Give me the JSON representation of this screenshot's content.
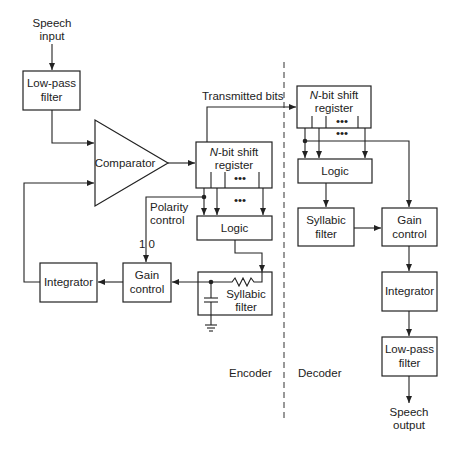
{
  "diagram": {
    "sections": {
      "encoder": "Encoder",
      "decoder": "Decoder"
    },
    "encoder": {
      "speech_input": [
        "Speech",
        "input"
      ],
      "lowpass": [
        "Low-pass",
        "filter"
      ],
      "comparator": "Comparator",
      "shift_register": {
        "prefix": "N",
        "line1": "-bit shift",
        "line2": "register"
      },
      "logic": "Logic",
      "polarity_control": [
        "Polarity",
        "control"
      ],
      "polarity_values": "1 0",
      "gain_control": [
        "Gain",
        "control"
      ],
      "integrator": "Integrator",
      "syllabic_filter": [
        "Syllabic",
        "filter"
      ],
      "dots": "•••"
    },
    "link": {
      "transmitted_bits": "Transmitted bits"
    },
    "decoder": {
      "shift_register": {
        "prefix": "N",
        "line1": "-bit shift",
        "line2": "register"
      },
      "logic": "Logic",
      "syllabic_filter": [
        "Syllabic",
        "filter"
      ],
      "gain_control": [
        "Gain",
        "control"
      ],
      "integrator": "Integrator",
      "lowpass": [
        "Low-pass",
        "filter"
      ],
      "speech_output": [
        "Speech",
        "output"
      ],
      "dots": "•••"
    }
  }
}
